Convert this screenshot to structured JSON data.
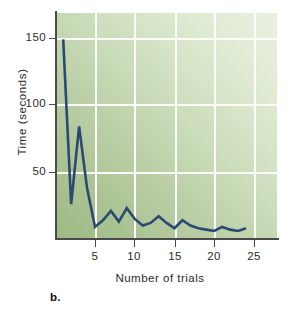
{
  "figure": {
    "panel_letter": "b.",
    "background_color": "#ffffff",
    "plot_bg_light": "#e9f0e1",
    "plot_bg_dark": "#9dba83",
    "line_color": "#2b4a73",
    "grid_color": "#fdfdfa",
    "axis_color": "#4a4a4a"
  },
  "chart_data": {
    "type": "line",
    "title": "",
    "subtitle": "",
    "xlabel": "Number of trials",
    "ylabel": "Time (seconds)",
    "xlim": [
      0,
      28
    ],
    "ylim": [
      0,
      163
    ],
    "xticks": [
      5,
      10,
      15,
      20,
      25
    ],
    "yticks": [
      50,
      100,
      150
    ],
    "xtick_labels": [
      "5",
      "10",
      "15",
      "20",
      "25"
    ],
    "ytick_labels": [
      "50",
      "100",
      "150"
    ],
    "grid": true,
    "grid_x": [
      5,
      10,
      15,
      20,
      25
    ],
    "grid_y": [
      50,
      100,
      150
    ],
    "legend": null,
    "legend_position": "none",
    "annotations": [
      "b."
    ],
    "series": [
      {
        "name": "Time per trial",
        "x": [
          1,
          2,
          3,
          4,
          5,
          6,
          7,
          8,
          9,
          10,
          11,
          12,
          13,
          14,
          15,
          16,
          17,
          18,
          19,
          20,
          21,
          22,
          23,
          24
        ],
        "values": [
          149,
          26,
          84,
          38,
          9,
          14,
          21,
          13,
          23,
          15,
          10,
          12,
          17,
          12,
          8,
          14,
          10,
          8,
          7,
          6,
          9,
          7,
          6,
          8
        ]
      }
    ]
  }
}
